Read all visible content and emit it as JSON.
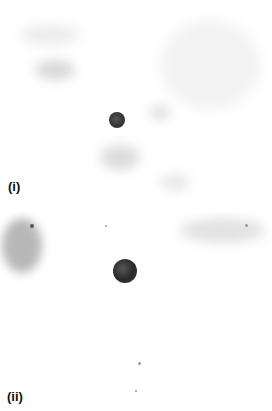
{
  "figure": {
    "panels": [
      {
        "id": "i",
        "label": "(i)",
        "description": "Grayscale micrograph with faint diffuse background staining and a single small dark round particle near center",
        "particle": {
          "cx": 117,
          "cy": 120,
          "r": 8,
          "color": "#3a3a3a"
        }
      },
      {
        "id": "ii",
        "label": "(ii)",
        "description": "Grayscale micrograph with a larger dark mottled round particle; speckled staining at upper-left and upper-right, sparse specks below",
        "particle": {
          "cx": 125,
          "cy": 59,
          "r": 12,
          "color": "#2e2e2e"
        }
      }
    ]
  }
}
